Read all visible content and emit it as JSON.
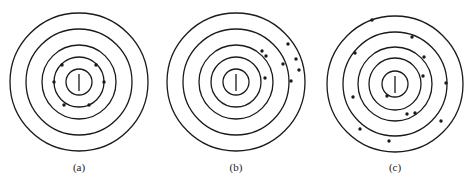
{
  "figure": {
    "panels": [
      {
        "label": "(a)",
        "center": [
          79,
          82
        ],
        "radii": [
          69,
          53,
          37,
          25,
          13
        ],
        "dots": [
          [
            62,
            65
          ],
          [
            96,
            65
          ],
          [
            54,
            82
          ],
          [
            104,
            82
          ],
          [
            64,
            105
          ],
          [
            89,
            105
          ]
        ]
      },
      {
        "label": "(b)",
        "center": [
          236,
          82
        ],
        "radii": [
          69,
          53,
          37,
          25,
          13
        ],
        "dots": [
          [
            288,
            44
          ],
          [
            262,
            51
          ],
          [
            266,
            56
          ],
          [
            283,
            64
          ],
          [
            296,
            59
          ],
          [
            299,
            70
          ],
          [
            265,
            78
          ],
          [
            291,
            81
          ]
        ]
      },
      {
        "label": "(c)",
        "center": [
          395,
          84
        ],
        "radii": [
          68,
          52,
          37,
          26,
          13
        ],
        "dots": [
          [
            372,
            20
          ],
          [
            412,
            37
          ],
          [
            355,
            53
          ],
          [
            424,
            57
          ],
          [
            423,
            76
          ],
          [
            446,
            83
          ],
          [
            353,
            97
          ],
          [
            387,
            96
          ],
          [
            407,
            114
          ],
          [
            415,
            113
          ],
          [
            441,
            121
          ],
          [
            360,
            129
          ],
          [
            389,
            141
          ]
        ]
      }
    ],
    "stroke_color": "#1a1a1a",
    "dot_color": "#1a1a1a"
  }
}
